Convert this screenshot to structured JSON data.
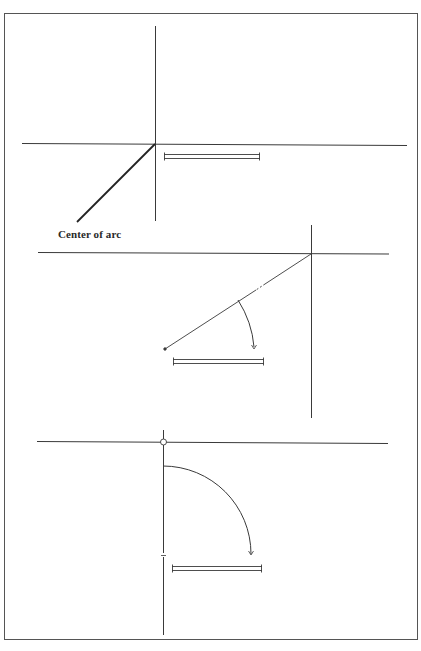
{
  "figure": {
    "background": "#ffffff",
    "stroke_color": "#3a3a3a",
    "frame": {
      "x": 4,
      "y": 13,
      "width": 414,
      "height": 627
    }
  },
  "panels": [
    {
      "id": "step-1",
      "label": "Center of arc",
      "label_pos": {
        "x": 58,
        "y": 228
      },
      "vertical_line": {
        "x1": 155,
        "y1": 26,
        "x2": 155,
        "y2": 221
      },
      "horizontal_line": {
        "x1": 22,
        "y1": 143,
        "x2": 407,
        "y2": 146
      },
      "pointer_line": {
        "x1": 155,
        "y1": 144,
        "x2": 77,
        "y2": 222
      },
      "double_bar": {
        "x1": 164,
        "x2": 260,
        "y1": 154,
        "y2": 158
      }
    },
    {
      "id": "step-2",
      "vertical_line": {
        "x1": 311,
        "y1": 225,
        "x2": 311,
        "y2": 418
      },
      "horizontal_line": {
        "x1": 38,
        "y1": 252,
        "x2": 389,
        "y2": 254
      },
      "radius_line": {
        "x1": 311,
        "y1": 254,
        "x2": 165,
        "y2": 349
      },
      "arc": {
        "x1": 238,
        "y1": 300,
        "x2": 254,
        "y2": 348
      },
      "double_bar": {
        "x1": 173,
        "x2": 264,
        "y1": 359,
        "y2": 364
      }
    },
    {
      "id": "step-3",
      "horizontal_line": {
        "x1": 37,
        "y1": 441,
        "x2": 388,
        "y2": 443
      },
      "vertical_line": {
        "x1": 163,
        "y1": 430,
        "x2": 163,
        "y2": 635
      },
      "pivot_circle": {
        "cx": 163,
        "cy": 442,
        "r": 3
      },
      "arc": {
        "cx": 163,
        "cy": 554,
        "r": 88
      },
      "double_bar": {
        "x1": 172,
        "x2": 262,
        "y1": 566,
        "y2": 571
      }
    }
  ]
}
